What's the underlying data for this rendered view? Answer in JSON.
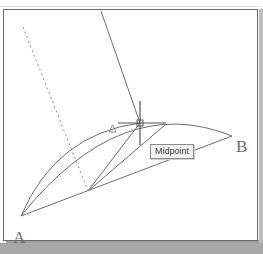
{
  "app": {
    "title": "CAD drawing canvas",
    "background_color": "#ffffff",
    "page_background_color": "#a8a8a8",
    "border_color": "#6b6b6b",
    "line_color": "#6d6d6d",
    "crosshair_color": "#555555"
  },
  "drawing": {
    "vertex_labels": [
      {
        "name": "label-a",
        "text": "A",
        "x": 9,
        "y": 219
      },
      {
        "name": "label-b",
        "text": "B",
        "x": 232,
        "y": 128
      }
    ],
    "points": {
      "a": {
        "x": 20,
        "y": 215
      },
      "b": {
        "x": 231,
        "y": 135
      },
      "midpoint": {
        "x": 139,
        "y": 122
      },
      "lower_vertex": {
        "x": 87,
        "y": 190
      }
    },
    "chord_ab": {
      "from": [
        20,
        215
      ],
      "to": [
        231,
        135
      ]
    },
    "arc_ab": {
      "from": [
        20,
        215
      ],
      "control": [
        120,
        90
      ],
      "to": [
        231,
        135
      ]
    },
    "inner_arc": {
      "from": [
        20,
        215
      ],
      "control": [
        70,
        125
      ],
      "to": [
        139,
        122
      ]
    },
    "dashed_line": {
      "from": [
        22,
        26
      ],
      "to": [
        87,
        190
      ],
      "dash": "2 3"
    },
    "solid_long_line": {
      "from": [
        100,
        10
      ],
      "to": [
        139,
        122
      ]
    },
    "spoke_left": {
      "from": [
        87,
        190
      ],
      "to": [
        139,
        122
      ]
    },
    "spoke_right": {
      "from": [
        87,
        190
      ],
      "to": [
        165,
        123
      ]
    },
    "snap_triangle": {
      "x": 108,
      "y": 124,
      "size": 7
    },
    "crosshair": {
      "center": [
        139,
        122
      ],
      "vertical": [
        100,
        144
      ],
      "horizontal": [
        117,
        165
      ]
    }
  },
  "tooltip": {
    "label": "Midpoint",
    "x": 146,
    "y": 134,
    "background": "#f2f2f2",
    "border_color": "#8a8a8a"
  }
}
